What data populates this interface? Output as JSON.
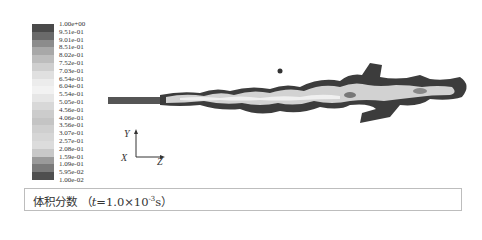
{
  "colorbar": {
    "labels": [
      "1.00e+00",
      "9.51e-01",
      "9.01e-01",
      "8.51e-01",
      "8.02e-01",
      "7.52e-01",
      "7.03e-01",
      "6.54e-01",
      "6.04e-01",
      "5.54e-01",
      "5.05e-01",
      "4.56e-01",
      "4.06e-01",
      "3.56e-01",
      "3.07e-01",
      "2.57e-01",
      "2.08e-01",
      "1.59e-01",
      "1.09e-01",
      "5.95e-02",
      "1.00e-02"
    ],
    "colors": [
      "#4a4a4a",
      "#6a6a6a",
      "#8c8c8c",
      "#a8a8a8",
      "#bdbdbd",
      "#cfcfcf",
      "#e0e0e0",
      "#ececec",
      "#f2f2f2",
      "#e6e6e6",
      "#d8d8d8",
      "#cccccc",
      "#c4c4c4",
      "#cfcfcf",
      "#d6d6d6",
      "#dcdcdc",
      "#c8c8c8",
      "#9a9a9a",
      "#7a7a7a",
      "#4f4f4f",
      "#3a3a3a"
    ]
  },
  "axes": {
    "y": "Y",
    "x": "X",
    "z": "Z"
  },
  "caption": {
    "prefix": "体积分数 （",
    "var": "t",
    "eq": "=1.0×10",
    "exp": "-3",
    "unit": "s）"
  }
}
